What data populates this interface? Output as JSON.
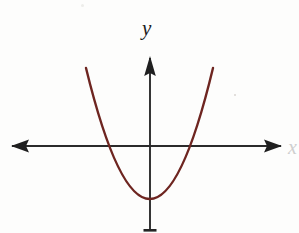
{
  "figure": {
    "title": "",
    "background_color": "#fdfdfc",
    "width": 299,
    "height": 233
  },
  "axes": {
    "y_label": "y",
    "x_label": "x",
    "axis_color": "#2b2b2b",
    "origin": {
      "x": 150,
      "y": 146
    },
    "x_axis": {
      "name": "x-axis",
      "y": 146,
      "x_start": 12,
      "x_end": 281,
      "arrow_left": true,
      "arrow_right": true
    },
    "y_axis": {
      "name": "y-axis",
      "x": 150,
      "y_top": 57,
      "y_bottom": 231,
      "arrow_up": true,
      "arrow_down": false
    }
  },
  "chart_data": {
    "type": "line",
    "title": "",
    "xlabel": "x",
    "ylabel": "y",
    "grid": false,
    "legend": null,
    "curves": [
      {
        "name": "parabola",
        "color": "#6e2520",
        "line_width": 2.4,
        "shape": "upward-opening parabola",
        "vertex": {
          "x": 150,
          "y": 199
        },
        "endpoints": [
          {
            "x": 86,
            "y": 68
          },
          {
            "x": 213,
            "y": 68
          }
        ],
        "x_intercepts": [
          110,
          190
        ],
        "y_intercept": 199,
        "path": "M 86,68 Q 150,330 213,68",
        "points": [
          {
            "x": 86,
            "y": 68
          },
          {
            "x": 98,
            "y": 110
          },
          {
            "x": 110,
            "y": 146
          },
          {
            "x": 122,
            "y": 172
          },
          {
            "x": 134,
            "y": 189
          },
          {
            "x": 150,
            "y": 199
          },
          {
            "x": 166,
            "y": 189
          },
          {
            "x": 178,
            "y": 172
          },
          {
            "x": 190,
            "y": 146
          },
          {
            "x": 202,
            "y": 110
          },
          {
            "x": 213,
            "y": 68
          }
        ]
      }
    ]
  },
  "marks": {
    "speck_upper_right": "faint-speck",
    "speck_top_center": "faint-speck"
  }
}
